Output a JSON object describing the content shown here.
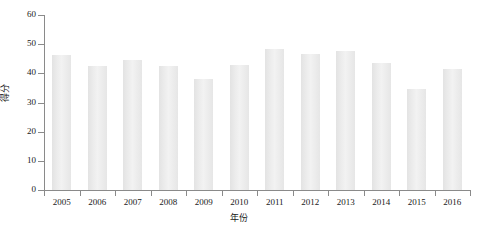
{
  "chart_data": {
    "type": "bar",
    "title": "",
    "xlabel": "年份",
    "ylabel": "得分",
    "categories": [
      "2005",
      "2006",
      "2007",
      "2008",
      "2009",
      "2010",
      "2011",
      "2012",
      "2013",
      "2014",
      "2015",
      "2016"
    ],
    "values": [
      46.3,
      42.6,
      44.5,
      42.6,
      38.0,
      43.0,
      48.5,
      46.5,
      47.5,
      43.7,
      34.8,
      41.5
    ],
    "ylim": [
      0,
      60
    ],
    "yticks": [
      0,
      10,
      20,
      30,
      40,
      50,
      60
    ],
    "ytick_labels": [
      "0",
      "10",
      "20",
      "30",
      "40",
      "50",
      "60"
    ],
    "grid": false,
    "legend": null,
    "bar_color": "#e8e8e8",
    "axis_color": "#8a8a8a",
    "text_color": "#1a1a1a"
  }
}
